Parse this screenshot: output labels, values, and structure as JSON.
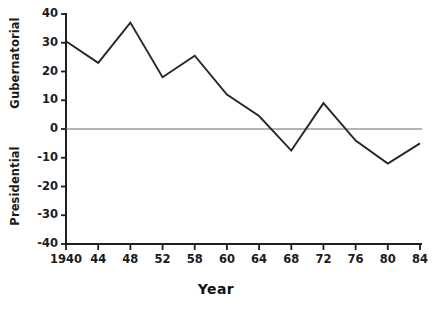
{
  "chart_data": {
    "type": "line",
    "title": "",
    "xlabel": "Year",
    "ylabel_top": "Gubernatorial",
    "ylabel_bottom": "Presidential",
    "x": [
      1940,
      1944,
      1948,
      1952,
      1958,
      1960,
      1964,
      1968,
      1972,
      1976,
      1980,
      1984
    ],
    "xtick_labels": [
      "1940",
      "44",
      "48",
      "52",
      "58",
      "60",
      "64",
      "68",
      "72",
      "76",
      "80",
      "84"
    ],
    "ytick_labels": [
      "40",
      "30",
      "20",
      "10",
      "0",
      "-10",
      "-20",
      "-30",
      "-40"
    ],
    "yticks": [
      40,
      30,
      20,
      10,
      0,
      -10,
      -20,
      -30,
      -40
    ],
    "ylim": [
      -40,
      40
    ],
    "xlim": [
      1940,
      1984
    ],
    "grid": false,
    "legend": null,
    "zero_line": 0,
    "series": [
      {
        "name": "Gubernatorial minus Presidential vote difference",
        "values": [
          30.5,
          23,
          37,
          18,
          25.5,
          12,
          4.5,
          -7.5,
          9,
          -4,
          -12,
          -5
        ],
        "color": "#262626"
      }
    ]
  },
  "axis": {
    "line_color": "#1f1f1f",
    "zero_line_color": "#6b6b6b"
  }
}
